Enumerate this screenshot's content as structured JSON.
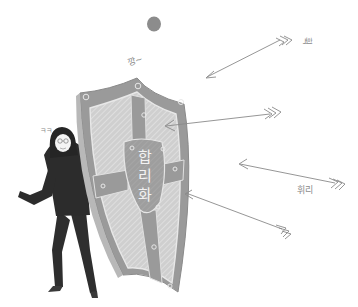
{
  "illustration": {
    "shield": {
      "label": "합\n리\n화",
      "fill_color": "#9a9a9a",
      "inner_color": "#c8c8c8",
      "rim_color": "#d6d6d6"
    },
    "figure": {
      "description": "hooded person in black suit hiding behind shield",
      "suit_color": "#2e2e2e",
      "face_color": "#f4f4f4"
    },
    "sound_effects": {
      "clang": "깡~",
      "whoosh_top": "휙",
      "whirl_right": "휘리",
      "giggle": "ㅋㅋ"
    },
    "arrows": [
      {
        "id": "arrow-top",
        "tail": [
          278,
          40
        ],
        "tip": [
          206,
          77
        ],
        "stuck": false
      },
      {
        "id": "arrow-mid",
        "tail": [
          282,
          113
        ],
        "tip": [
          166,
          126
        ],
        "stuck": true
      },
      {
        "id": "arrow-right",
        "tail": [
          343,
          183
        ],
        "tip": [
          238,
          163
        ],
        "stuck": false
      },
      {
        "id": "arrow-low",
        "tail": [
          290,
          232
        ],
        "tip": [
          184,
          193
        ],
        "stuck": true
      }
    ],
    "ball": {
      "color": "#8c8c8c"
    }
  }
}
